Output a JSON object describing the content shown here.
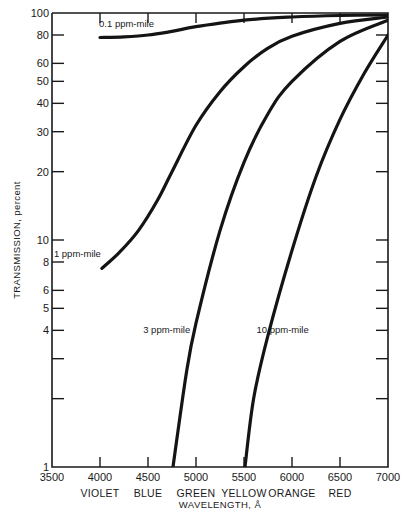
{
  "chart_data": {
    "type": "line",
    "title": "",
    "xlabel": "WAVELENGTH, Å",
    "ylabel": "TRANSMISSION, percent",
    "xlim": [
      3500,
      7000
    ],
    "ylim": [
      1,
      100
    ],
    "yscale": "log",
    "grid": false,
    "legend": "inline curve labels",
    "x_ticks": [
      3500,
      4000,
      4500,
      5000,
      5500,
      6000,
      6500,
      7000
    ],
    "x_tick_labels": [
      "3500",
      "4000",
      "4500",
      "5000",
      "5500",
      "6000",
      "6500",
      "7000"
    ],
    "x_color_labels": [
      {
        "x": 4000,
        "label": "VIOLET"
      },
      {
        "x": 4500,
        "label": "BLUE"
      },
      {
        "x": 5000,
        "label": "GREEN"
      },
      {
        "x": 5500,
        "label": "YELLOW"
      },
      {
        "x": 6000,
        "label": "ORANGE"
      },
      {
        "x": 6500,
        "label": "RED"
      }
    ],
    "y_ticks": [
      1,
      2,
      3,
      4,
      5,
      6,
      8,
      10,
      20,
      30,
      40,
      50,
      60,
      80,
      100
    ],
    "y_tick_labels": {
      "1": "1",
      "4": "4",
      "5": "5",
      "6": "6",
      "8": "8",
      "10": "10",
      "20": "20",
      "30": "30",
      "40": "40",
      "50": "50",
      "60": "60",
      "80": "80",
      "100": "100"
    },
    "series": [
      {
        "name": "0.1 ppm-mile",
        "label": "0.1 ppm-mile",
        "label_pos": {
          "x": 3990,
          "y": 87
        },
        "x": [
          4000,
          4250,
          4500,
          4750,
          5000,
          5500,
          6000,
          6500,
          7000
        ],
        "values": [
          78,
          78.5,
          80,
          83,
          87,
          93,
          96,
          97.5,
          98
        ]
      },
      {
        "name": "1 ppm-mile",
        "label": "1 ppm-mile",
        "label_pos": {
          "x": 3520,
          "y": 8.4
        },
        "x": [
          4020,
          4200,
          4400,
          4600,
          4750,
          5000,
          5250,
          5500,
          5750,
          6000,
          6500,
          7000
        ],
        "values": [
          7.5,
          8.8,
          11,
          15,
          20,
          32,
          45,
          58,
          70,
          79,
          90,
          96
        ]
      },
      {
        "name": "3 ppm-mile",
        "label": "3 ppm-mile",
        "label_pos": {
          "x": 4450,
          "y": 3.9
        },
        "x": [
          4760,
          4900,
          5000,
          5250,
          5500,
          5750,
          6000,
          6500,
          7000
        ],
        "values": [
          1,
          2.6,
          4.3,
          11,
          22,
          36,
          50,
          75,
          93
        ]
      },
      {
        "name": "10 ppm-mile",
        "label": "10 ppm-mile",
        "label_pos": {
          "x": 5630,
          "y": 3.9
        },
        "x": [
          5510,
          5600,
          5750,
          6000,
          6250,
          6500,
          6750,
          7000
        ],
        "values": [
          1,
          2.0,
          3.8,
          9,
          19,
          34,
          54,
          80
        ]
      }
    ]
  },
  "axes": {
    "y_title": "TRANSMISSION, percent",
    "x_title": "WAVELENGTH, Å"
  }
}
